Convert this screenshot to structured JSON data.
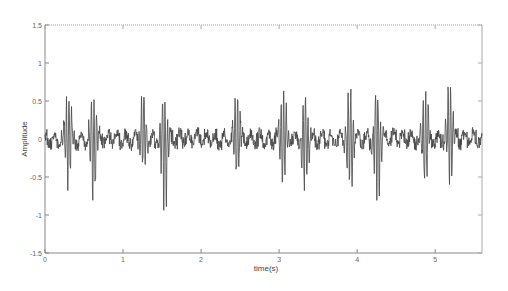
{
  "chart_data": {
    "type": "line",
    "title": "",
    "xlabel": "time(s)",
    "ylabel": "Amplitude",
    "xlim": [
      0,
      5.6
    ],
    "ylim": [
      -1.5,
      1.5
    ],
    "xticks": [
      0,
      1,
      2,
      3,
      4,
      5
    ],
    "xtick_labels": [
      "0",
      "1",
      "2",
      "3",
      "4",
      "5"
    ],
    "yticks": [
      1.5,
      1,
      0.5,
      0,
      -0.5,
      -1,
      -1.5
    ],
    "ytick_labels": [
      "1.5",
      "1",
      "0.5",
      "0",
      "-0.5",
      "-1",
      "-1.5"
    ],
    "grid": false,
    "legend": null,
    "line_color": "#444444",
    "series": [
      {
        "name": "signal",
        "description": "Oscillating amplitude signal around 0 with baseline noise ~±0.15 and periodic bursts",
        "bursts": [
          {
            "t": 0.3,
            "peak": 0.62,
            "trough": -0.55
          },
          {
            "t": 0.62,
            "peak": 0.6,
            "trough": -0.85
          },
          {
            "t": 1.26,
            "peak": 0.6,
            "trough": -0.45
          },
          {
            "t": 1.53,
            "peak": 0.52,
            "trough": -1.05
          },
          {
            "t": 2.46,
            "peak": 0.75,
            "trough": -0.45
          },
          {
            "t": 3.05,
            "peak": 0.7,
            "trough": -0.55
          },
          {
            "t": 3.33,
            "peak": 0.55,
            "trough": -0.8
          },
          {
            "t": 3.91,
            "peak": 0.78,
            "trough": -0.7
          },
          {
            "t": 4.26,
            "peak": 0.58,
            "trough": -0.95
          },
          {
            "t": 4.87,
            "peak": 0.8,
            "trough": -0.6
          },
          {
            "t": 5.19,
            "peak": 0.85,
            "trough": -0.5
          }
        ],
        "baseline_noise": 0.15
      }
    ]
  },
  "plot": {
    "left": 45,
    "right": 482,
    "top": 25,
    "bottom": 253
  }
}
